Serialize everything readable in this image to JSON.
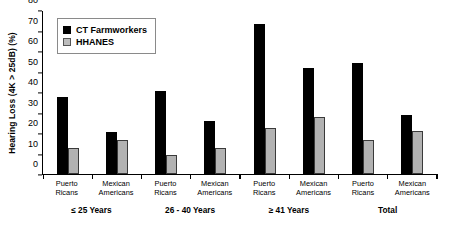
{
  "chart_data": {
    "type": "bar",
    "title": "",
    "xlabel": "",
    "ylabel": "Hearing Loss (4K > 25dB) (%)",
    "ylim": [
      0,
      80
    ],
    "yticks": [
      0,
      10,
      20,
      30,
      40,
      50,
      60,
      70,
      80
    ],
    "grid": false,
    "legend_position": "top-left",
    "categories": [
      "Puerto Ricans",
      "Mexican Americans",
      "Puerto Ricans",
      "Mexican Americans",
      "Puerto Ricans",
      "Mexican Americans",
      "Puerto Ricans",
      "Mexican Americans"
    ],
    "category_lines": [
      [
        "Puerto",
        "Ricans"
      ],
      [
        "Mexican",
        "Americans"
      ],
      [
        "Puerto",
        "Ricans"
      ],
      [
        "Mexican",
        "Americans"
      ],
      [
        "Puerto",
        "Ricans"
      ],
      [
        "Mexican",
        "Americans"
      ],
      [
        "Puerto",
        "Ricans"
      ],
      [
        "Mexican",
        "Americans"
      ]
    ],
    "groups": [
      {
        "label": "≤ 25 Years",
        "span": 2
      },
      {
        "label": "26 - 40 Years",
        "span": 2
      },
      {
        "label": "≥ 41 Years",
        "span": 2
      },
      {
        "label": "Total",
        "span": 2
      }
    ],
    "series": [
      {
        "name": "CT Farmworkers",
        "color": "#000000",
        "values": [
          37.5,
          20.5,
          40.5,
          26.0,
          73.0,
          51.5,
          54.0,
          29.0
        ]
      },
      {
        "name": "HHANES",
        "color": "#b2b2b2",
        "values": [
          12.5,
          16.5,
          9.5,
          12.5,
          22.5,
          28.0,
          16.5,
          21.0
        ]
      }
    ]
  },
  "legend": {
    "items": [
      {
        "label": "CT Farmworkers",
        "swatch": "black-square-marker"
      },
      {
        "label": "HHANES",
        "swatch": "gray-square-marker"
      }
    ]
  }
}
